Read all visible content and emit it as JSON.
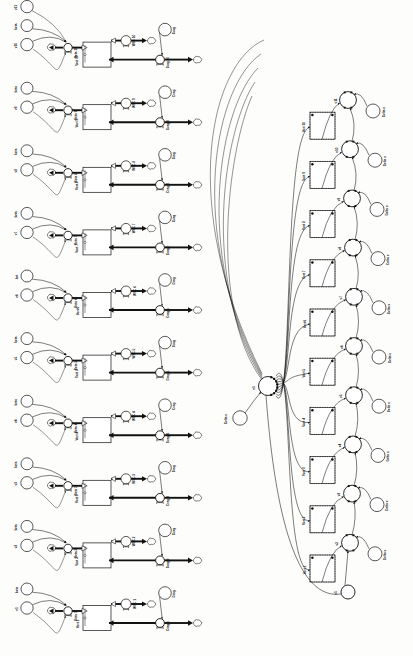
{
  "document": {
    "title": "Vortex Model Stock-and-Flow Diagram",
    "orientation": "rotated-90-ccw",
    "background_color": "#fdfdfc",
    "line_color": "#111111",
    "panel_count": 2
  },
  "left_panel": {
    "name": "stock-flow-panel",
    "unit_count": 10,
    "units": [
      {
        "stock": "Vort 1",
        "beta_flow": "Beta 1",
        "wsc": "WSC 1",
        "drag_flow": "Drag 1",
        "in_var": "v1",
        "beta_src": "beta",
        "drag_aux": "Drag"
      },
      {
        "stock": "Vort 2",
        "beta_flow": "Beta 2",
        "wsc": "WSC 2",
        "drag_flow": "Drag 2",
        "in_var": "v2",
        "beta_src": "beta",
        "drag_aux": "Drag"
      },
      {
        "stock": "Vort 3",
        "beta_flow": "Beta 3",
        "wsc": "WSC 3",
        "drag_flow": "Drag 3",
        "in_var": "v3",
        "beta_src": "beta",
        "drag_aux": "Drag"
      },
      {
        "stock": "Vort 4",
        "beta_flow": "Beta 4",
        "wsc": "WSC 4",
        "drag_flow": "Drag 4",
        "in_var": "v4",
        "beta_src": "beta",
        "drag_aux": "Drag"
      },
      {
        "stock": "Vort 5",
        "beta_flow": "Beta 5",
        "wsc": "WSC 5",
        "drag_flow": "Drag 5",
        "in_var": "v5",
        "beta_src": "beta",
        "drag_aux": "Drag"
      },
      {
        "stock": "Vort 6",
        "beta_flow": "Beta 6",
        "wsc": "WSC 6",
        "drag_flow": "Drag 6",
        "in_var": "v6",
        "beta_src": "bet",
        "drag_aux": "Drag"
      },
      {
        "stock": "Vort 7",
        "beta_flow": "Beta 7",
        "wsc": "WSC 7",
        "drag_flow": "Drag 7",
        "in_var": "v7",
        "beta_src": "beta",
        "drag_aux": "Drag"
      },
      {
        "stock": "Vort 8",
        "beta_flow": "Beta 8",
        "wsc": "WSC 8",
        "drag_flow": "Drag 8",
        "in_var": "v8",
        "beta_src": "beta",
        "drag_aux": "Drag"
      },
      {
        "stock": "Vort 9",
        "beta_flow": "Beta 9",
        "wsc": "WSC 9",
        "drag_flow": "Drag 9",
        "in_var": "v9",
        "beta_src": "beta",
        "drag_aux": "Drag"
      },
      {
        "stock": "Vort 10",
        "beta_flow": "Beta 10",
        "wsc": "WSC 10",
        "drag_flow": "Drag 10",
        "in_var": "v10",
        "beta_src": "beta",
        "drag_aux": "Drag"
      }
    ],
    "top_extra_var": "v11",
    "top_extra_beta": "beta",
    "top_first_var": "v1"
  },
  "right_panel": {
    "name": "causal-graph-panel",
    "hub_node": "v1",
    "hub_delta": "Delta x",
    "stocks": [
      "Vort 1",
      "Vort 2",
      "Vort 3",
      "Vort 4",
      "Vort 5",
      "Vort 6",
      "Vort 7",
      "Vort 8",
      "Vort 9",
      "Vort 10"
    ],
    "velocity_nodes": [
      "v1",
      "v2",
      "v3",
      "v4",
      "v5",
      "v6",
      "v7",
      "v8",
      "v9",
      "v10",
      "v11"
    ],
    "delta_label": "Delta x",
    "delta_nodes": [
      {
        "for": "v2",
        "label": "Delta x"
      },
      {
        "for": "v3",
        "label": "Delta x"
      },
      {
        "for": "v4",
        "label": "Delta x"
      },
      {
        "for": "v5",
        "label": "Delta x"
      },
      {
        "for": "v6",
        "label": "Delta x"
      },
      {
        "for": "v7",
        "label": "Delta x"
      },
      {
        "for": "v8",
        "label": "Delta x"
      },
      {
        "for": "v9",
        "label": "Delta x"
      },
      {
        "for": "v10",
        "label": "Delta x"
      },
      {
        "for": "v11",
        "label": "Delta x"
      }
    ]
  },
  "icons": {
    "cloud": "cloud-sink-icon",
    "valve": "flow-valve-icon",
    "stock_box": "stock-box-icon",
    "aux_circle": "auxiliary-variable-icon",
    "arrow": "causal-arrow-icon"
  }
}
